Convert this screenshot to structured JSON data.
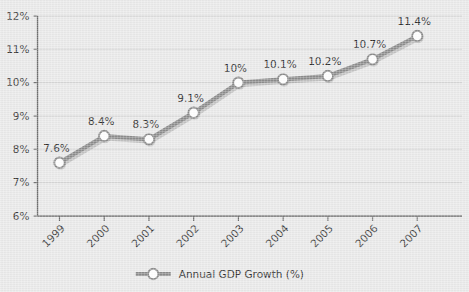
{
  "chart_data": {
    "type": "line",
    "title": "",
    "subtitle": "",
    "xlabel": "",
    "ylabel": "",
    "categories": [
      "1999",
      "2000",
      "2001",
      "2002",
      "2003",
      "2004",
      "2005",
      "2006",
      "2007"
    ],
    "series": [
      {
        "name": "Annual GDP Growth (%)",
        "values": [
          7.6,
          8.4,
          8.3,
          9.1,
          10,
          10.1,
          10.2,
          10.7,
          11.4
        ],
        "point_labels": [
          "7.6%",
          "8.4%",
          "8.3%",
          "9.1%",
          "10%",
          "10.1%",
          "10.2%",
          "10.7%",
          "11.4%"
        ],
        "line_color": "#8c8c8c",
        "marker_fill": "#ffffff",
        "marker_edge": "#8c8c8c"
      }
    ],
    "ylim": [
      6,
      12
    ],
    "ytick_values": [
      6,
      7,
      8,
      9,
      10,
      11,
      12
    ],
    "ytick_labels": [
      "6%",
      "7%",
      "8%",
      "9%",
      "10%",
      "11%",
      "12%"
    ],
    "grid": true,
    "grid_axis": "y",
    "grid_color": "#d2d2d2",
    "axis_color": "#6e6e6e",
    "background_color": "#e9e9e9",
    "xtick_label_rotation": -45,
    "legend": {
      "position": "bottom-center",
      "entries": [
        "Annual GDP Growth (%)"
      ]
    }
  }
}
